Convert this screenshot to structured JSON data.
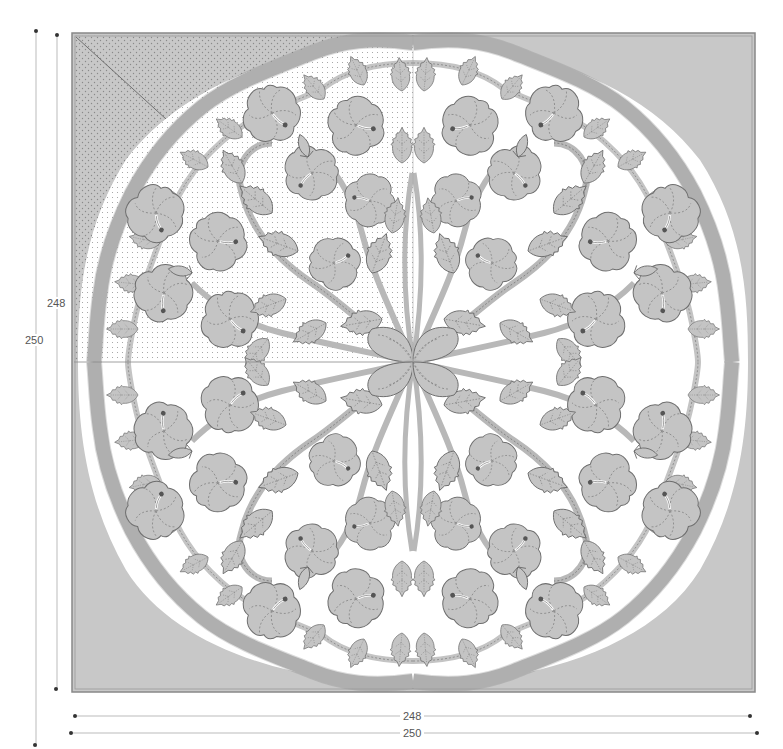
{
  "figure": {
    "type": "quilt-pattern-diagram",
    "symmetry": "four-fold mirrored quadrants",
    "quilting_detail_shown_in": "top-left quadrant (echo quilting)"
  },
  "dimensions": {
    "vertical_inner": {
      "label": "248"
    },
    "vertical_outer": {
      "label": "250"
    },
    "horizontal_inner": {
      "label": "248"
    },
    "horizontal_outer": {
      "label": "250"
    }
  },
  "colors": {
    "background_fabric": "#c8c8c8",
    "appliqué_fill": "#c4c4c4",
    "cutout": "#ffffff",
    "outline": "#6e6e6e",
    "stitch": "#7a7a7a",
    "frame": "#888888",
    "dim_line": "#bbbbbb",
    "dim_dot": "#333333"
  },
  "motifs": {
    "flower": "hibiscus",
    "leaf": "serrated leaf",
    "center": "four-petal medallion"
  }
}
